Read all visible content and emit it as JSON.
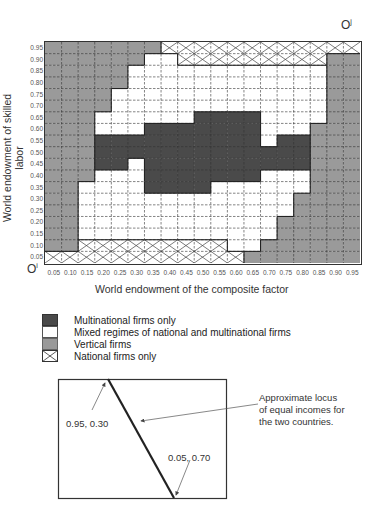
{
  "chart_data": {
    "type": "heatmap",
    "title": "",
    "xlabel": "World endowment of the composite factor",
    "ylabel": "World endowment of skilled labor",
    "x_ticks": [
      "0.05",
      "0.10",
      "0.15",
      "0.20",
      "0.25",
      "0.30",
      "0.35",
      "0.40",
      "0.45",
      "0.50",
      "0.55",
      "0.60",
      "0.65",
      "0.70",
      "0.75",
      "0.80",
      "0.85",
      "0.90",
      "0.95"
    ],
    "y_ticks_top_to_bottom": [
      "0.95",
      "0.90",
      "0.85",
      "0.80",
      "0.75",
      "0.70",
      "0.65",
      "0.60",
      "0.55",
      "0.50",
      "0.45",
      "0.40",
      "0.35",
      "0.30",
      "0.25",
      "0.20",
      "0.15",
      "0.10",
      "0.05"
    ],
    "category_codes": {
      "M": "Multinational firms only",
      "X": "Mixed regimes of national and multinational firms",
      "V": "Vertical firms",
      "N": "National firms only"
    },
    "rows_top_to_bottom": [
      "VVVVVVVNNNNNNNNNNNN",
      "VVVVVVXXNNNNNNNNNVV",
      "VVVVVXXXXXXXXXXXXVV",
      "VVVVVXXXXXXXXXXXXVV",
      "VVVVXXXXXXXXXXXXXVV",
      "VVVVXXXXXXXXXXXXXVV",
      "VVVXXXXXXMMMMXXXXVV",
      "VVVXXXMMMMMMMXXXVVV",
      "VVVMMMMMMMMMMXMMVVV",
      "VVVMMMMMMMMMMMMMVVV",
      "VVVMMXMMMMMMMMMMVVV",
      "VVVXXXMMMMMMMXXXVVV",
      "VVXXXXMMMMXXXXXXVVV",
      "VVXXXXXXXXXXXXXVVVV",
      "VVXXXXXXXXXXXXXVVVV",
      "VVXXXXXXXXXXXXVVVVV",
      "VVXXXXXXXXXXXXVVVVV",
      "VVNNNNNNNNNXXVVVVVV",
      "NNNNNNNNNNNNVVVVVVV"
    ],
    "colors": {
      "M": "#4a4a4a",
      "X": "#ffffff",
      "V": "#9a9a9a",
      "N": "#ffffff"
    },
    "xlim": [
      0,
      1
    ],
    "ylim": [
      0,
      1
    ],
    "grid": true,
    "legend_position": "below"
  },
  "origins": {
    "bottom_left": "O",
    "bottom_left_sup": "i",
    "top_right": "O",
    "top_right_sup": "j"
  },
  "legend": [
    {
      "code": "M",
      "label": "Multinational firms only"
    },
    {
      "code": "X",
      "label": "Mixed regimes of national and multinational firms"
    },
    {
      "code": "V",
      "label": "Vertical firms"
    },
    {
      "code": "N",
      "label": "National firms only"
    }
  ],
  "diagram": {
    "top_point_label": "0.95, 0.30",
    "bottom_point_label": "0.05, 0.70",
    "annotation_line1": "Approximate locus",
    "annotation_line2": "of equal incomes for",
    "annotation_line3": "the two countries."
  }
}
